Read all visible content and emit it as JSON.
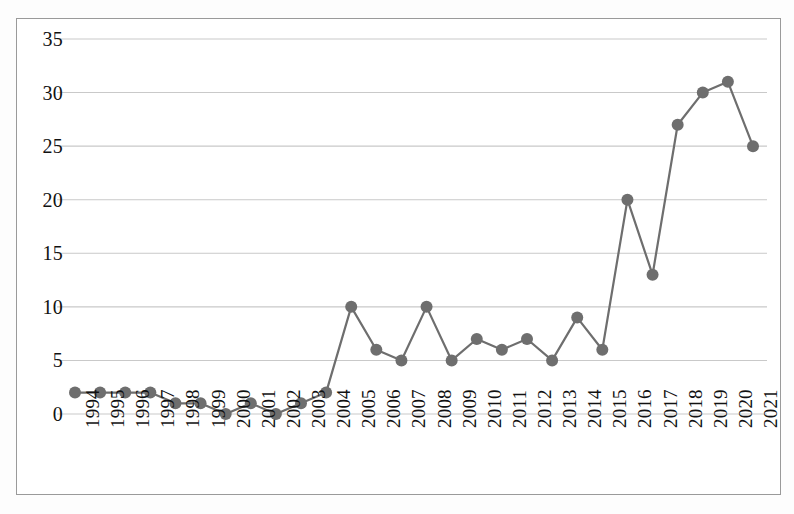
{
  "chart_data": {
    "type": "line",
    "title": "",
    "subtitle": "",
    "xlabel": "",
    "ylabel": "",
    "categories": [
      "1994",
      "1995",
      "1996",
      "1997",
      "1998",
      "1999",
      "2000",
      "2001",
      "2002",
      "2003",
      "2004",
      "2005",
      "2006",
      "2007",
      "2008",
      "2009",
      "2010",
      "2011",
      "2012",
      "2013",
      "2014",
      "2015",
      "2016",
      "2017",
      "2018",
      "2019",
      "2020",
      "2021"
    ],
    "values": [
      2,
      2,
      2,
      2,
      1,
      1,
      0,
      1,
      0,
      1,
      2,
      10,
      6,
      5,
      10,
      5,
      7,
      6,
      7,
      5,
      9,
      6,
      20,
      13,
      27,
      30,
      31,
      25
    ],
    "series": [
      {
        "name": "",
        "values": [
          2,
          2,
          2,
          2,
          1,
          1,
          0,
          1,
          0,
          1,
          2,
          10,
          6,
          5,
          10,
          5,
          7,
          6,
          7,
          5,
          9,
          6,
          20,
          13,
          27,
          30,
          31,
          25
        ]
      }
    ],
    "ytick_labels": [
      "0",
      "5",
      "10",
      "15",
      "20",
      "25",
      "30",
      "35"
    ],
    "ytick_values": [
      0,
      5,
      10,
      15,
      20,
      25,
      30,
      35
    ],
    "ylim": [
      0,
      35
    ],
    "xlim_index": [
      0,
      27
    ],
    "grid": {
      "horizontal": true,
      "vertical": false,
      "color": "#c9c9c9"
    },
    "legend": {
      "visible": false,
      "position": "none",
      "entries": []
    },
    "marker": {
      "shape": "circle",
      "color": "#6e6e6e",
      "radius": 6
    },
    "line": {
      "color": "#6e6e6e",
      "width": 2.2
    },
    "frame": {
      "border_color": "#9a9a9a",
      "background": "#ffffff"
    },
    "axis_line_color": "#9a9a9a",
    "text_color": "#111111"
  }
}
